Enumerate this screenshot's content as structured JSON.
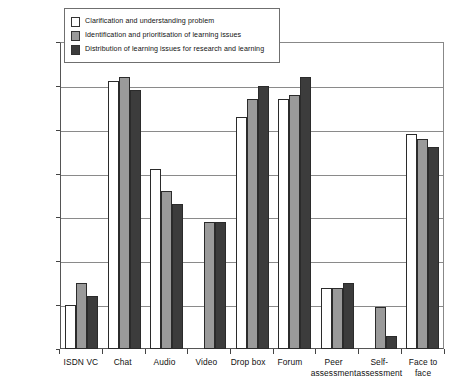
{
  "chart_data": {
    "type": "bar",
    "title": "",
    "xlabel": "",
    "ylabel": "",
    "ylim": [
      0,
      70
    ],
    "yticks": [
      0,
      10,
      20,
      30,
      40,
      50,
      60,
      70
    ],
    "grid": true,
    "legend_position": "top-left-inside",
    "categories": [
      "ISDN VC",
      "Chat",
      "Audio",
      "Video",
      "Drop box",
      "Forum",
      "Peer assessment",
      "Self-assessment",
      "Face to face"
    ],
    "category_lines": [
      [
        "ISDN VC"
      ],
      [
        "Chat"
      ],
      [
        "Audio"
      ],
      [
        "Video"
      ],
      [
        "Drop box"
      ],
      [
        "Forum"
      ],
      [
        "Peer",
        "assessment"
      ],
      [
        "Self-",
        "assessment"
      ],
      [
        "Face to",
        "face"
      ]
    ],
    "series": [
      {
        "name": "Clarification and understanding problem",
        "color": "#ffffff",
        "values": [
          10,
          61,
          41,
          0,
          53,
          57,
          14,
          0,
          49
        ]
      },
      {
        "name": "Identification and prioritisation of learning issues",
        "color": "#9a9a9a",
        "values": [
          15,
          62,
          36,
          29,
          57,
          58,
          14,
          9.5,
          48
        ]
      },
      {
        "name": "Distribution of learning issues for research and learning",
        "color": "#3c3c3c",
        "values": [
          12,
          59,
          33,
          29,
          60,
          62,
          15,
          3,
          46
        ]
      }
    ]
  }
}
